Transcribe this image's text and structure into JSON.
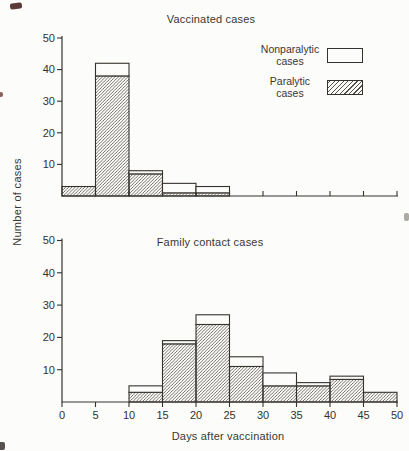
{
  "meta": {
    "bg": "#fcfcfa",
    "ink": "#35322e",
    "hatch_line": "#55504a"
  },
  "ylabel": "Number of cases",
  "xlabel": "Days after vaccination",
  "legend": {
    "items": [
      {
        "line1": "Nonparalytic",
        "line2": "cases",
        "swatch": "white"
      },
      {
        "line1": "Paralytic",
        "line2": "cases",
        "swatch": "hatch"
      }
    ]
  },
  "chart_data": [
    {
      "type": "bar",
      "variant": "stacked-histogram",
      "title": "Vaccinated cases",
      "bin_edges": [
        0,
        5,
        10,
        15,
        20,
        25,
        30,
        35,
        40,
        45,
        50
      ],
      "series": [
        {
          "name": "Paralytic cases",
          "pattern": "hatch",
          "values": [
            3,
            38,
            7,
            1,
            1,
            0,
            0,
            0,
            0,
            0
          ]
        },
        {
          "name": "Nonparalytic cases",
          "pattern": "white",
          "values": [
            0,
            4,
            1,
            3,
            2,
            0,
            0,
            0,
            0,
            0
          ]
        }
      ],
      "ylim": [
        0,
        50
      ],
      "yticks": [
        10,
        20,
        30,
        40,
        50
      ],
      "xticks": [
        0,
        5,
        10,
        15,
        20,
        25,
        30,
        35,
        40,
        45,
        50
      ],
      "show_x_tick_labels": false,
      "grid": false,
      "legend_position": "upper-right"
    },
    {
      "type": "bar",
      "variant": "stacked-histogram",
      "title": "Family contact cases",
      "bin_edges": [
        0,
        5,
        10,
        15,
        20,
        25,
        30,
        35,
        40,
        45,
        50
      ],
      "series": [
        {
          "name": "Paralytic cases",
          "pattern": "hatch",
          "values": [
            0,
            0,
            3,
            18,
            24,
            11,
            5,
            5,
            7,
            3
          ]
        },
        {
          "name": "Nonparalytic cases",
          "pattern": "white",
          "values": [
            0,
            0,
            2,
            1,
            3,
            3,
            4,
            1,
            1,
            0
          ]
        }
      ],
      "ylim": [
        0,
        50
      ],
      "yticks": [
        10,
        20,
        30,
        40,
        50
      ],
      "xticks": [
        0,
        5,
        10,
        15,
        20,
        25,
        30,
        35,
        40,
        45,
        50
      ],
      "show_x_tick_labels": true,
      "grid": false
    }
  ]
}
